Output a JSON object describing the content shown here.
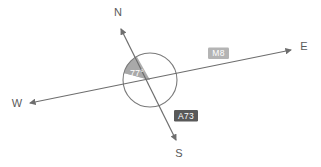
{
  "figure": {
    "type": "geometry-compass-diagram",
    "background_color": "#ffffff",
    "stroke_color": "#6e6e6e",
    "compass": {
      "north_label": "N",
      "east_label": "E",
      "south_label": "S",
      "west_label": "W"
    },
    "angle": {
      "value_label": "77°",
      "sector_fill": "#a8a8a8",
      "text_color": "#ffffff"
    },
    "roads": [
      {
        "id": "road-m8",
        "label": "M8",
        "badge_fill": "#b4b4b4",
        "badge_text_color": "#ffffff",
        "axis": "west-east"
      },
      {
        "id": "road-a73",
        "label": "A73",
        "badge_fill": "#595959",
        "badge_text_color": "#ffffff",
        "axis": "north-south"
      }
    ],
    "circle": {
      "center_x": 150,
      "center_y": 80,
      "radius": 27,
      "stroke": "#7a7a7a",
      "fill": "none"
    }
  }
}
